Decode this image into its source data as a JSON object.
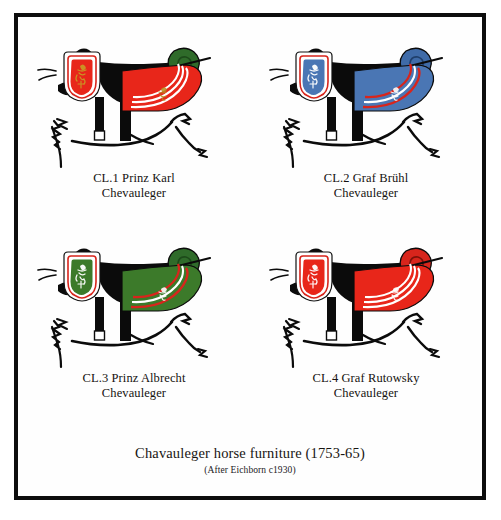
{
  "plate": {
    "title": "Chavauleger horse furniture (1753-65)",
    "subtitle": "(After Eichborn c1930)",
    "frame_color": "#0d0d0d",
    "background_color": "#ffffff"
  },
  "palette": {
    "red": "#e8261a",
    "blue": "#4a76b4",
    "green": "#3c7a2a",
    "white": "#ffffff",
    "black": "#000000",
    "stripe_red": "#d8251c",
    "outline": "#111111"
  },
  "figures": [
    {
      "id": "cl1",
      "code": "CL.1",
      "name": "Prinz Karl",
      "caption_line1": "CL.1 Prinz Karl",
      "caption_line2": "Chevauleger",
      "shabraque_color": "#e8261a",
      "shabraque_stripe_color": "#ffffff",
      "shabraque_stripe_secondary": "#e8261a",
      "chest_piece_color": "#e8261a",
      "chest_piece_border": "#ffffff",
      "cloak_roll_color": "#2f6b2a",
      "crest_color": "#b8901f"
    },
    {
      "id": "cl2",
      "code": "CL.2",
      "name": "Graf Brühl",
      "caption_line1": "CL.2 Graf Brühl",
      "caption_line2": "Chevauleger",
      "shabraque_color": "#4a76b4",
      "shabraque_stripe_color": "#ffffff",
      "shabraque_stripe_secondary": "#d8251c",
      "chest_piece_color": "#4a76b4",
      "chest_piece_border": "#ffffff",
      "cloak_roll_color": "#3f6ba8",
      "crest_color": "#ffffff"
    },
    {
      "id": "cl3",
      "code": "CL.3",
      "name": "Prinz Albrecht",
      "caption_line1": "CL.3 Prinz Albrecht",
      "caption_line2": "Chevauleger",
      "shabraque_color": "#3c7a2a",
      "shabraque_stripe_color": "#ffffff",
      "shabraque_stripe_secondary": "#d8251c",
      "chest_piece_color": "#3c7a2a",
      "chest_piece_border": "#ffffff",
      "cloak_roll_color": "#2f6b2a",
      "crest_color": "#ffffff"
    },
    {
      "id": "cl4",
      "code": "CL.4",
      "name": "Graf Rutowsky",
      "caption_line1": "CL.4 Graf Rutowsky",
      "caption_line2": "Chevauleger",
      "shabraque_color": "#e8261a",
      "shabraque_stripe_color": "#ffffff",
      "shabraque_stripe_secondary": "#e8261a",
      "chest_piece_color": "#e8261a",
      "chest_piece_border": "#ffffff",
      "cloak_roll_color": "#d8251c",
      "crest_color": "#ffffff"
    }
  ]
}
